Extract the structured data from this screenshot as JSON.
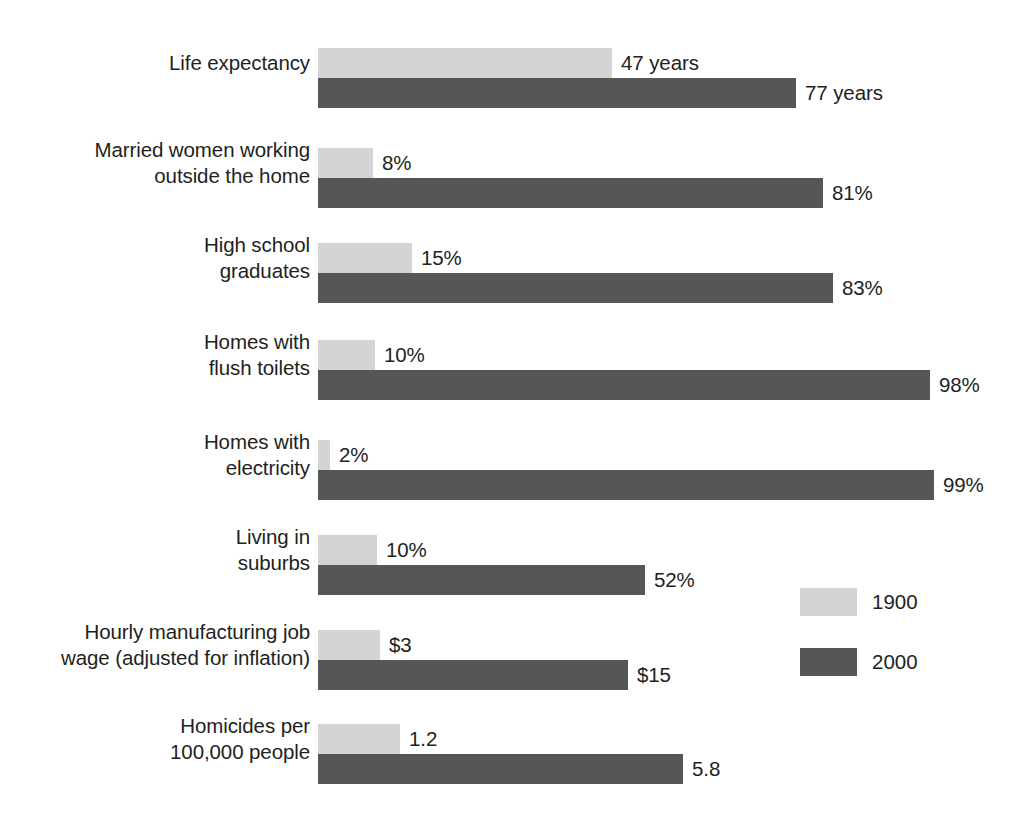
{
  "chart_data": {
    "type": "bar",
    "title": "",
    "subtitle": "",
    "xlabel": "",
    "ylabel": "",
    "orientation": "horizontal",
    "grid": false,
    "legend_position": "right-middle",
    "note": "Each category is drawn on its own independent scale; bar lengths within a category are proportional to that category's two values.",
    "categories": [
      "Life expectancy",
      "Married women working outside the home",
      "High school graduates",
      "Homes with flush toilets",
      "Homes with electricity",
      "Living in suburbs",
      "Hourly manufacturing job wage (adjusted for inflation)",
      "Homicides per 100,000 people"
    ],
    "series": [
      {
        "name": "1900",
        "color": "#d4d4d4",
        "values": [
          47,
          8,
          15,
          10,
          2,
          10,
          3,
          1.2
        ],
        "value_labels": [
          "47 years",
          "8%",
          "15%",
          "10%",
          "2%",
          "10%",
          "$3",
          "1.2"
        ]
      },
      {
        "name": "2000",
        "color": "#565656",
        "values": [
          77,
          81,
          83,
          98,
          99,
          52,
          15,
          5.8
        ],
        "value_labels": [
          "77 years",
          "81%",
          "83%",
          "98%",
          "99%",
          "52%",
          "$15",
          "5.8"
        ]
      }
    ]
  },
  "rows": [
    {
      "label": "Life expectancy",
      "top": 48,
      "bar1900": {
        "width": 294,
        "value_label": "47 years",
        "label_x": 303
      },
      "bar2000": {
        "width": 478,
        "value_label": "77 years",
        "label_x": 487
      }
    },
    {
      "label": "Married women working\noutside the home",
      "top": 148,
      "bar1900": {
        "width": 55,
        "value_label": "8%",
        "label_x": 64
      },
      "bar2000": {
        "width": 505,
        "value_label": "81%",
        "label_x": 514
      }
    },
    {
      "label": "High school\ngraduates",
      "top": 243,
      "bar1900": {
        "width": 94,
        "value_label": "15%",
        "label_x": 103
      },
      "bar2000": {
        "width": 515,
        "value_label": "83%",
        "label_x": 524
      }
    },
    {
      "label": "Homes with\nflush toilets",
      "top": 340,
      "bar1900": {
        "width": 57,
        "value_label": "10%",
        "label_x": 66
      },
      "bar2000": {
        "width": 612,
        "value_label": "98%",
        "label_x": 621
      }
    },
    {
      "label": "Homes with\nelectricity",
      "top": 440,
      "bar1900": {
        "width": 12,
        "value_label": "2%",
        "label_x": 21
      },
      "bar2000": {
        "width": 616,
        "value_label": "99%",
        "label_x": 625
      }
    },
    {
      "label": "Living in\nsuburbs",
      "top": 535,
      "bar1900": {
        "width": 59,
        "value_label": "10%",
        "label_x": 68
      },
      "bar2000": {
        "width": 327,
        "value_label": "52%",
        "label_x": 336
      }
    },
    {
      "label": "Hourly manufacturing job\nwage (adjusted for inflation)",
      "top": 630,
      "bar1900": {
        "width": 62,
        "value_label": "$3",
        "label_x": 71
      },
      "bar2000": {
        "width": 310,
        "value_label": "$15",
        "label_x": 319
      }
    },
    {
      "label": "Homicides per\n100,000 people",
      "top": 724,
      "bar1900": {
        "width": 82,
        "value_label": "1.2",
        "label_x": 91
      },
      "bar2000": {
        "width": 365,
        "value_label": "5.8",
        "label_x": 374
      }
    }
  ],
  "legend": {
    "items": [
      {
        "label": "1900",
        "color": "#d4d4d4"
      },
      {
        "label": "2000",
        "color": "#565656"
      }
    ]
  },
  "colors": {
    "series_1900": "#d4d4d4",
    "series_2000": "#565656",
    "text": "#231f20",
    "background": "#ffffff"
  }
}
